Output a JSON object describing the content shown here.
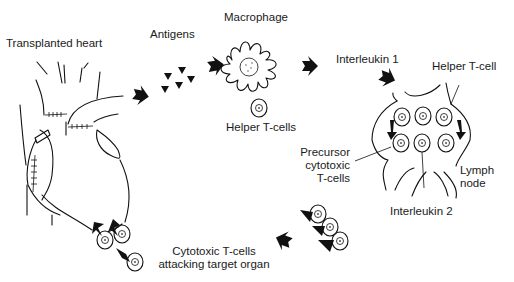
{
  "diagram": {
    "labels": {
      "transplanted_heart": "Transplanted heart",
      "antigens": "Antigens",
      "macrophage": "Macrophage",
      "helper_t_cells": "Helper T-cells",
      "interleukin_1": "Interleukin 1",
      "helper_t_cell": "Helper T-cell",
      "precursor_line1": "Precursor",
      "precursor_line2": "cytotoxic",
      "precursor_line3": "T-cells",
      "lymph_line1": "Lymph",
      "lymph_line2": "node",
      "interleukin_2": "Interleukin 2",
      "cytotoxic_line1": "Cytotoxic T-cells",
      "cytotoxic_line2": "attacking target organ"
    },
    "icons": [
      "heart-illustration",
      "antigen-icon",
      "macrophage-icon",
      "t-cell-icon",
      "lymph-node-icon",
      "flow-arrow-icon"
    ],
    "colors": {
      "ink": "#111111",
      "background": "#ffffff"
    }
  }
}
